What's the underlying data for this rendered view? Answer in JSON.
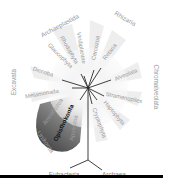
{
  "diagram": {
    "type": "radial-phylogeny",
    "center": [
      88,
      88
    ],
    "supergroups": [
      {
        "label": "Archaeplastida",
        "x": 60,
        "y": 26,
        "rot": -28,
        "size": 6.4
      },
      {
        "label": "Rhizaria",
        "x": 125,
        "y": 19,
        "rot": 30,
        "size": 6.4
      },
      {
        "label": "Chromalveolata",
        "x": 156,
        "y": 87,
        "rot": 90,
        "size": 6.4
      },
      {
        "label": "Excavata",
        "x": 14,
        "y": 82,
        "rot": -90,
        "size": 6.4
      },
      {
        "label": "Unikonta",
        "x": 45,
        "y": 142,
        "rot": 55,
        "size": 6.4
      }
    ],
    "clades": [
      {
        "label": "Viridiplantae",
        "x": 81,
        "y": 48,
        "rot": 80,
        "size": 5.8
      },
      {
        "label": "Rhodophyta",
        "x": 69,
        "y": 50,
        "rot": 60,
        "size": 5.8
      },
      {
        "label": "Glaucophyta",
        "x": 60,
        "y": 56,
        "rot": 45,
        "size": 5.8
      },
      {
        "label": "Cercozoa",
        "x": 96,
        "y": 48,
        "rot": -80,
        "size": 5.8
      },
      {
        "label": "Retaria",
        "x": 110,
        "y": 52,
        "rot": -52,
        "size": 5.8
      },
      {
        "label": "Alveolata",
        "x": 126,
        "y": 75,
        "rot": -22,
        "size": 5.8
      },
      {
        "label": "Stramenopiles",
        "x": 124,
        "y": 98,
        "rot": 12,
        "size": 5.8
      },
      {
        "label": "Haptophyta",
        "x": 114,
        "y": 113,
        "rot": 50,
        "size": 5.8
      },
      {
        "label": "Cryptophyta",
        "x": 99,
        "y": 123,
        "rot": 70,
        "size": 5.8
      },
      {
        "label": "Rhizaria2",
        "x": 0,
        "y": 0,
        "rot": 0,
        "size": 0
      },
      {
        "label": "Diccoba",
        "x": 43,
        "y": 72,
        "rot": 18,
        "size": 5.8
      },
      {
        "label": "Metamonada",
        "x": 42,
        "y": 94,
        "rot": -10,
        "size": 5.8
      },
      {
        "label": "Amoebozoa",
        "x": 53,
        "y": 112,
        "rot": -55,
        "size": 5.8
      },
      {
        "label": "Opisthokonta",
        "x": 64,
        "y": 123,
        "rot": -65,
        "size": 6.2,
        "emphasis": true
      },
      {
        "label": "Apusozoa",
        "x": 74,
        "y": 128,
        "rot": -80,
        "size": 5.8
      }
    ],
    "prokaryotes": [
      {
        "label": "Eubacteria",
        "x": 64,
        "y": 175
      },
      {
        "label": "Archaea",
        "x": 114,
        "y": 175
      }
    ],
    "colors": {
      "label": "#9a9a9a",
      "label_dark": "#111111",
      "branch": "#333333",
      "wedge_dark": "#5a5a5a"
    }
  }
}
